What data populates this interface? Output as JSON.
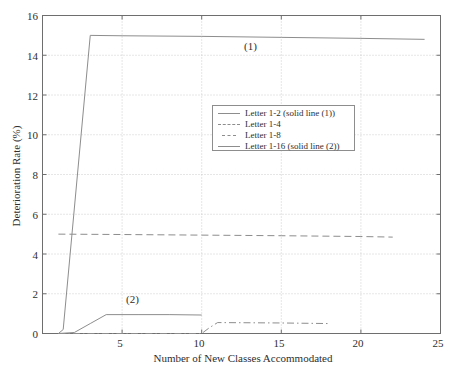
{
  "chart_data": {
    "type": "line",
    "title": "",
    "xlabel": "Number of New Classes Accommodated",
    "ylabel": "Deterioration Rate (%)",
    "xlim": [
      0,
      25
    ],
    "ylim": [
      0,
      16
    ],
    "xticks": [
      5,
      10,
      15,
      20,
      25
    ],
    "yticks": [
      0,
      2,
      4,
      6,
      8,
      10,
      12,
      14,
      16
    ],
    "grid": true,
    "legend_position": "upper-center",
    "line_color": "#8d8d8d",
    "series": [
      {
        "name": "Letter 1-2 (solid line (1))",
        "style": "solid",
        "x": [
          1,
          1.3,
          3,
          5,
          10,
          15,
          20,
          24
        ],
        "y": [
          0,
          0.2,
          15.0,
          14.98,
          14.95,
          14.9,
          14.85,
          14.8
        ]
      },
      {
        "name": "Letter 1-4",
        "style": "dashed",
        "x": [
          1,
          5,
          10,
          15,
          20,
          22
        ],
        "y": [
          5.0,
          4.98,
          4.95,
          4.92,
          4.88,
          4.85
        ]
      },
      {
        "name": "Letter 1-8",
        "style": "dashdot",
        "x": [
          1,
          5,
          10,
          10.5,
          11,
          15,
          18
        ],
        "y": [
          0.0,
          0.0,
          0.0,
          0.3,
          0.55,
          0.53,
          0.5
        ]
      },
      {
        "name": "Letter 1-16 (solid line (2))",
        "style": "solid",
        "x": [
          1,
          2,
          3,
          4,
          6,
          8,
          10
        ],
        "y": [
          0.0,
          0.05,
          0.5,
          0.95,
          0.95,
          0.95,
          0.93
        ]
      }
    ],
    "annotations": [
      {
        "text": "(1)",
        "x": 13.8,
        "y": 14.0
      },
      {
        "text": "(2)",
        "x": 6.4,
        "y": 1.75
      }
    ]
  },
  "legend": {
    "entries": [
      {
        "label": "Letter 1-2 (solid line (1))",
        "style": "solid"
      },
      {
        "label": "Letter 1-4",
        "style": "dashed"
      },
      {
        "label": "Letter 1-8",
        "style": "dashdot"
      },
      {
        "label": "Letter 1-16 (solid line (2))",
        "style": "solid"
      }
    ]
  },
  "axes": {
    "x_label": "Number of New Classes Accommodated",
    "y_label": "Deterioration Rate (%)",
    "x_ticks": [
      "5",
      "10",
      "15",
      "20",
      "25"
    ],
    "y_ticks": [
      "0",
      "2",
      "4",
      "6",
      "8",
      "10",
      "12",
      "14",
      "16"
    ]
  },
  "annotations": {
    "one": "(1)",
    "two": "(2)"
  }
}
